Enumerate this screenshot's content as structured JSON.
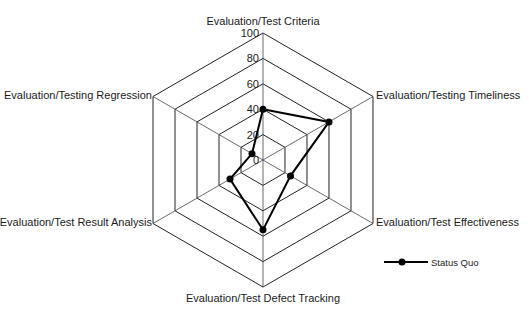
{
  "chart_data": {
    "type": "radar",
    "title": "",
    "axes": [
      "Evaluation/Test Criteria",
      "Evaluation/Testing Timeliness",
      "Evaluation/Test Effectiveness",
      "Evaluation/Test Defect Tracking",
      "Evaluation/Test Result Analysis",
      "Evaluation/Testing Regression"
    ],
    "series": [
      {
        "name": "Status Quo",
        "values": [
          40,
          60,
          25,
          55,
          30,
          10
        ],
        "color": "#000000"
      }
    ],
    "rlim": [
      0,
      100
    ],
    "ticks": [
      "0",
      "20",
      "40",
      "60",
      "80",
      "100"
    ],
    "legend_position": "bottom-right",
    "grid": true
  },
  "legend": {
    "label": "Status Quo"
  }
}
